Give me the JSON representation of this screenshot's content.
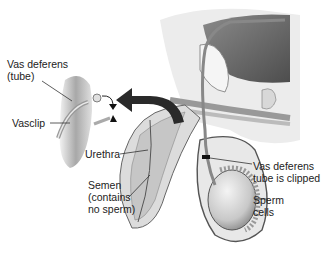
{
  "diagram": {
    "labels": {
      "vas_deferens_tube": "Vas deferens\n(tube)",
      "vasclip": "Vasclip",
      "urethra": "Urethra",
      "semen": "Semen\n(contains\nno sperm)",
      "vas_clipped": "Vas deferens\ntube is clipped",
      "sperm_cells": "Sperm\ncells"
    },
    "colors": {
      "arrow": "#2a2a2a",
      "tissue_light": "#e6e6e6",
      "tissue_mid": "#bdbdbd",
      "tissue_dark": "#6a6a6a",
      "line": "#333333"
    }
  }
}
